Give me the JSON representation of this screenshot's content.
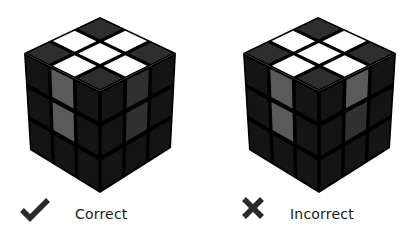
{
  "colors": {
    "background": "#ffffff",
    "gap": "#000000",
    "white": "#ffffff",
    "dark_top": "#2e2e2e",
    "dark_side": "#141414",
    "gray_light": "#5a5a5a",
    "gray_dark": "#303030",
    "icon": "#2a2a2a"
  },
  "examples": [
    {
      "id": "correct",
      "label": "Correct",
      "icon": "checkmark-icon",
      "geometry": {
        "top": [
          100,
          17
        ],
        "left": [
          24,
          53
        ],
        "right": [
          176,
          53
        ],
        "center": [
          100,
          91
        ],
        "bottom_left": [
          30,
          150
        ],
        "bottom": [
          100,
          193
        ],
        "bottom_right": [
          171,
          148
        ]
      },
      "top_face": [
        [
          "dark",
          "white",
          "dark"
        ],
        [
          "white",
          "white",
          "white"
        ],
        [
          "dark",
          "white",
          "dark"
        ]
      ],
      "left_face": [
        [
          "dark",
          "gray_light",
          "dark"
        ],
        [
          "dark",
          "gray_light",
          "dark"
        ],
        [
          "dark",
          "dark",
          "dark"
        ]
      ],
      "right_face": [
        [
          "dark",
          "gray_dark",
          "dark"
        ],
        [
          "dark",
          "gray_dark",
          "dark"
        ],
        [
          "dark",
          "dark",
          "dark"
        ]
      ]
    },
    {
      "id": "incorrect",
      "label": "Incorrect",
      "icon": "cross-icon",
      "geometry": {
        "top": [
          318,
          17
        ],
        "left": [
          243,
          53
        ],
        "right": [
          396,
          53
        ],
        "center": [
          319,
          91
        ],
        "bottom_left": [
          249,
          150
        ],
        "bottom": [
          319,
          193
        ],
        "bottom_right": [
          390,
          148
        ]
      },
      "top_face": [
        [
          "dark",
          "white",
          "dark"
        ],
        [
          "white",
          "white",
          "white"
        ],
        [
          "dark",
          "white",
          "dark"
        ]
      ],
      "left_face": [
        [
          "dark",
          "gray_light",
          "dark"
        ],
        [
          "dark",
          "gray_light",
          "dark"
        ],
        [
          "dark",
          "dark",
          "dark"
        ]
      ],
      "right_face": [
        [
          "dark",
          "gray_light",
          "dark"
        ],
        [
          "dark",
          "gray_dark",
          "dark"
        ],
        [
          "dark",
          "dark",
          "dark"
        ]
      ]
    }
  ]
}
